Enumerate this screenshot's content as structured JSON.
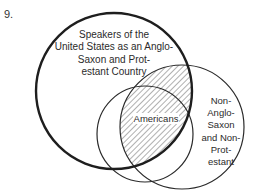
{
  "figure": {
    "number": "9."
  },
  "circles": {
    "speakers": {
      "label": "Speakers of the\nUnited States as an Anglo-\nSaxon and Prot-\nestant Country",
      "cx": 114,
      "cy": 91,
      "r": 78,
      "stroke_width": 2.4
    },
    "non_anglo": {
      "label": "Non-\nAnglo-\nSaxon\nand Non-\nProt-\nestant",
      "cx": 182,
      "cy": 127,
      "r": 62,
      "stroke_width": 1.2
    },
    "americans": {
      "label": "Americans",
      "cx": 145,
      "cy": 134,
      "r": 48,
      "stroke_width": 1.2
    }
  },
  "shading": {
    "region": "intersection of Speakers circle and Non-Anglo-Saxon circle",
    "pattern": "diagonal-hatch"
  },
  "colors": {
    "stroke": "#2a2a2a",
    "background": "#ffffff"
  }
}
